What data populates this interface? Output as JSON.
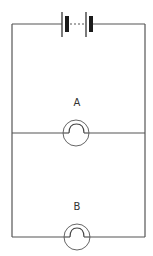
{
  "diagram": {
    "type": "electric circuit",
    "battery": {
      "cells": 2,
      "connector": "dashed"
    },
    "bulbs": [
      {
        "label": "A",
        "position": "middle branch"
      },
      {
        "label": "B",
        "position": "bottom branch"
      }
    ],
    "colors": {
      "wire": "#555555",
      "cell": "#1a1a1a",
      "background": "#ffffff"
    }
  }
}
